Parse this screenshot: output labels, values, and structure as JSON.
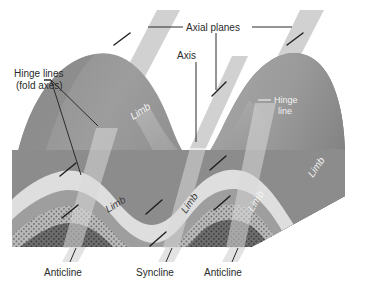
{
  "diagram": {
    "background_color": "#ffffff"
  },
  "labels": {
    "axial_planes": "Axial planes",
    "axis": "Axis",
    "hinge_lines_line1": "Hinge lines",
    "hinge_lines_line2": "(fold axes)",
    "hinge_line_right_line1": "Hinge",
    "hinge_line_right_line2": "line",
    "limb_upper_left": "Limb",
    "limb_upper_right": "Limb",
    "limb_front_left": "Limb",
    "limb_front_mid": "Limb",
    "limb_front_right": "Limb",
    "anticline_left": "Anticline",
    "syncline": "Syncline",
    "anticline_right": "Anticline"
  },
  "colors": {
    "background": "#ffffff",
    "text_dark": "#2b2b2b",
    "text_light": "#f2f2f2",
    "axial_plane": "#c9c9c9",
    "fold_surface_light": "#a8a8a8",
    "fold_surface_mid": "#969696",
    "fold_surface_dark": "#7d7d7d",
    "stratum_pale": "#dcdcdc",
    "stratum_light": "#c4c4c4",
    "stratum_mid": "#9a9a9a",
    "stratum_dark": "#6e6e6e",
    "stratum_core": "#585858",
    "leader_line": "#2b2b2b"
  },
  "strata": [
    {
      "name": "outer-surface",
      "color": "#8f8f8f"
    },
    {
      "name": "pale-band",
      "color": "#dcdcdc"
    },
    {
      "name": "stipple-band",
      "color": "#b3b3b3"
    },
    {
      "name": "mid-band",
      "color": "#8a8a8a"
    },
    {
      "name": "core-band",
      "color": "#606060"
    }
  ]
}
